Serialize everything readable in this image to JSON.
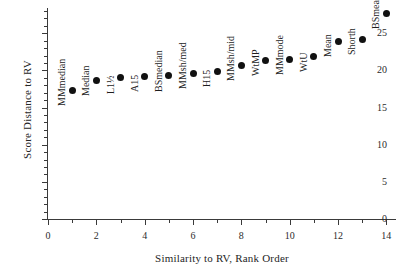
{
  "chart_data": {
    "type": "scatter",
    "title": "",
    "xlabel": "Similarity to RV, Rank Order",
    "ylabel": "Score Distance to RV",
    "xlim": [
      0,
      14.4
    ],
    "ylim": [
      0,
      28.4
    ],
    "grid": false,
    "legend": "none",
    "x_ticks_major": [
      0,
      2,
      4,
      6,
      8,
      10,
      12,
      14
    ],
    "x_ticks_minor": [
      1,
      3,
      5,
      7,
      9,
      11,
      13
    ],
    "y_ticks_major": [
      0,
      5,
      10,
      15,
      20,
      25
    ],
    "y_ticks_minor": [
      1,
      2,
      3,
      4,
      6,
      7,
      8,
      9,
      11,
      12,
      13,
      14,
      16,
      17,
      18,
      19,
      21,
      22,
      23,
      24,
      26,
      27,
      28
    ],
    "x_tick_labels": [
      "0",
      "2",
      "4",
      "6",
      "8",
      "10",
      "12",
      "14"
    ],
    "y_tick_labels": [
      "0",
      "5",
      "10",
      "15",
      "20",
      "25"
    ],
    "categories": [
      "MMmedian",
      "Median",
      "L1½",
      "A15",
      "BSmedian",
      "MMsh/med",
      "H15",
      "MMsh/mid",
      "WtMP",
      "MMmode",
      "WtU",
      "Mean",
      "Shorth",
      "BSmean"
    ],
    "x": [
      1,
      2,
      3,
      4,
      5,
      6,
      7,
      8,
      9,
      10,
      11,
      12,
      13,
      14
    ],
    "values": [
      17.3,
      18.7,
      19.0,
      19.2,
      19.3,
      19.6,
      19.9,
      20.7,
      21.4,
      21.5,
      21.9,
      23.9,
      24.2,
      27.7
    ],
    "point_labels": [
      "MMmedian",
      "Median",
      "L1½",
      "A15",
      "BSmedian",
      "MMsh/med",
      "H15",
      "MMsh/mid",
      "WtMP",
      "MMmode",
      "WtU",
      "Mean",
      "Shorth",
      "BSmean"
    ],
    "marker": "filled-circle",
    "marker_color": "#111111",
    "axis_color": "#3a3a3a"
  }
}
